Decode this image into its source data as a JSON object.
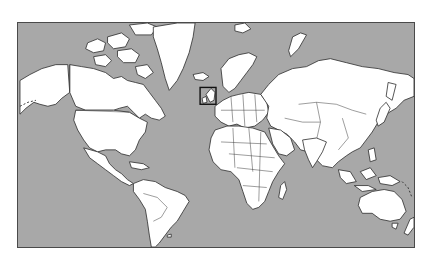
{
  "map": {
    "projection": "mercator",
    "ocean_color": "#a8a8a8",
    "land_color": "#ffffff",
    "border_color": "#2b2b2b",
    "highlight": {
      "region": "United Kingdom and Ireland",
      "box_color": "#111111"
    }
  }
}
